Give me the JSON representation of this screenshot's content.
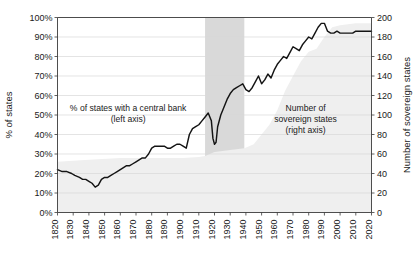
{
  "chart_data": {
    "type": "line",
    "title": "",
    "xlabel": "",
    "ylabel": "% of states",
    "y2label": "Number of sovereign states",
    "xlim": [
      1820,
      2020
    ],
    "ylim": [
      0,
      100
    ],
    "y2lim": [
      0,
      200
    ],
    "grid": true,
    "legend_position": "inline-annotations",
    "x_ticks": [
      1820,
      1830,
      1840,
      1850,
      1860,
      1870,
      1880,
      1890,
      1900,
      1910,
      1920,
      1930,
      1940,
      1950,
      1960,
      1970,
      1980,
      1990,
      2000,
      2010,
      2020
    ],
    "y_ticks": [
      0,
      10,
      20,
      30,
      40,
      50,
      60,
      70,
      80,
      90,
      100
    ],
    "y_tick_labels": [
      "0%",
      "10%",
      "20%",
      "30%",
      "40%",
      "50%",
      "60%",
      "70%",
      "80%",
      "90%",
      "100%"
    ],
    "y2_ticks": [
      0,
      20,
      40,
      60,
      80,
      100,
      120,
      140,
      160,
      180,
      200
    ],
    "y2_tick_labels": [
      "0",
      "20",
      "40",
      "60",
      "80",
      "100",
      "120",
      "140",
      "160",
      "180",
      "200"
    ],
    "annotations": [
      {
        "name": "left-series-annotation",
        "lines": [
          "% of states with a central bank",
          "(left axis)"
        ],
        "x": 1865,
        "y": 52
      },
      {
        "name": "right-series-annotation",
        "lines": [
          "Number of",
          "sovereign states",
          "(right axis)"
        ],
        "x": 1978,
        "y": 52
      }
    ],
    "shaded_bands": [
      {
        "name": "interwar-war-band",
        "x_start": 1914,
        "x_end": 1939,
        "color": "#d9d9d9"
      }
    ],
    "series": [
      {
        "name": "% of states with a central bank",
        "axis": "left",
        "type": "line",
        "color": "#141414",
        "x": [
          1820,
          1823,
          1826,
          1829,
          1831,
          1834,
          1836,
          1838,
          1840,
          1842,
          1844,
          1846,
          1848,
          1850,
          1852,
          1854,
          1856,
          1858,
          1860,
          1862,
          1864,
          1866,
          1868,
          1870,
          1872,
          1874,
          1876,
          1878,
          1880,
          1882,
          1884,
          1886,
          1888,
          1890,
          1892,
          1894,
          1896,
          1898,
          1900,
          1902,
          1904,
          1906,
          1908,
          1910,
          1912,
          1914,
          1916,
          1918,
          1919,
          1920,
          1921,
          1922,
          1924,
          1926,
          1928,
          1930,
          1932,
          1934,
          1936,
          1938,
          1940,
          1942,
          1944,
          1946,
          1948,
          1950,
          1952,
          1954,
          1956,
          1958,
          1960,
          1962,
          1964,
          1966,
          1968,
          1970,
          1972,
          1974,
          1976,
          1978,
          1980,
          1982,
          1984,
          1986,
          1988,
          1990,
          1992,
          1994,
          1996,
          1998,
          2000,
          2002,
          2004,
          2006,
          2008,
          2010,
          2012,
          2014,
          2016,
          2018,
          2020
        ],
        "y": [
          22,
          21,
          21,
          20,
          19,
          18,
          17,
          17,
          16,
          15,
          13,
          14,
          17,
          18,
          18,
          19,
          20,
          21,
          22,
          23,
          24,
          24,
          25,
          26,
          27,
          28,
          28,
          30,
          33,
          34,
          34,
          34,
          34,
          33,
          33,
          34,
          35,
          35,
          34,
          33,
          40,
          43,
          44,
          45,
          47,
          49,
          51,
          47,
          38,
          35,
          36,
          44,
          50,
          54,
          58,
          61,
          63,
          64,
          65,
          66,
          63,
          62,
          64,
          67,
          70,
          66,
          68,
          71,
          69,
          73,
          76,
          78,
          80,
          79,
          82,
          85,
          84,
          83,
          86,
          88,
          90,
          89,
          92,
          95,
          97,
          97,
          93,
          92,
          92,
          93,
          92,
          92,
          92,
          92,
          92,
          93,
          93,
          93,
          93,
          93,
          93
        ]
      },
      {
        "name": "Number of sovereign states",
        "axis": "right",
        "type": "area",
        "color": "#efefef",
        "x": [
          1820,
          1840,
          1860,
          1880,
          1900,
          1910,
          1914,
          1920,
          1930,
          1939,
          1945,
          1950,
          1955,
          1960,
          1965,
          1970,
          1975,
          1980,
          1985,
          1990,
          1995,
          2000,
          2010,
          2020
        ],
        "y": [
          52,
          54,
          56,
          56,
          56,
          57,
          58,
          62,
          64,
          66,
          70,
          80,
          90,
          105,
          125,
          140,
          155,
          165,
          168,
          180,
          190,
          192,
          194,
          194
        ]
      }
    ]
  }
}
